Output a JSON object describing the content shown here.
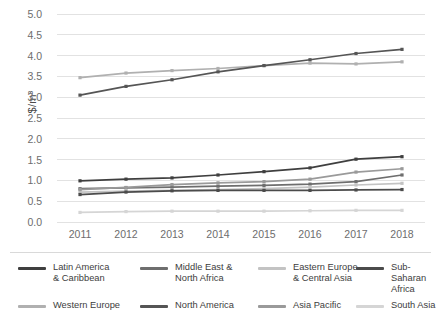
{
  "chart_data": {
    "type": "line",
    "title": "",
    "xlabel": "",
    "ylabel": "$/m³",
    "x": [
      2011,
      2012,
      2013,
      2014,
      2015,
      2016,
      2017,
      2018
    ],
    "xtick_labels": [
      "2011",
      "2012",
      "2013",
      "2014",
      "2015",
      "2016",
      "2017",
      "2018"
    ],
    "ytick_labels": [
      "5.0",
      "4.5",
      "4.0",
      "3.5",
      "3.0",
      "2.5",
      "2.0",
      "1.5",
      "1.0",
      "0.5",
      "0.0"
    ],
    "ylim": [
      0.0,
      5.0
    ],
    "ytick_step": 0.5,
    "grid": "horizontal",
    "legend_position": "bottom",
    "markers": true,
    "series": [
      {
        "name": "Latin America\n& Caribbean",
        "legend_label": "Latin America\n& Caribbean",
        "color": "#3f3f3f",
        "values": [
          0.99,
          1.03,
          1.06,
          1.13,
          1.21,
          1.3,
          1.51,
          1.57
        ]
      },
      {
        "name": "Middle East &\nNorth Africa",
        "legend_label": "Middle East &\nNorth Africa",
        "color": "#6e6e6e",
        "values": [
          0.8,
          0.82,
          0.84,
          0.86,
          0.88,
          0.91,
          0.97,
          1.13
        ]
      },
      {
        "name": "Eastern Europe\n& Central Asia",
        "legend_label": "Eastern Europe\n& Central Asia",
        "color": "#c3c3c3",
        "values": [
          0.72,
          0.74,
          0.76,
          0.78,
          0.8,
          0.84,
          0.89,
          0.93
        ]
      },
      {
        "name": "Sub-Saharan\nAfrica",
        "legend_label": "Sub-Saharan\nAfrica",
        "color": "#4b4b4b",
        "values": [
          0.66,
          0.72,
          0.75,
          0.76,
          0.76,
          0.76,
          0.77,
          0.78
        ]
      },
      {
        "name": "Western Europe",
        "legend_label": "Western Europe",
        "color": "#b0b0b0",
        "values": [
          3.47,
          3.58,
          3.64,
          3.69,
          3.76,
          3.82,
          3.8,
          3.85
        ]
      },
      {
        "name": "North America",
        "legend_label": "North America",
        "color": "#555555",
        "values": [
          3.05,
          3.26,
          3.42,
          3.61,
          3.76,
          3.9,
          4.05,
          4.15
        ]
      },
      {
        "name": "Asia Pacific",
        "legend_label": "Asia Pacific",
        "color": "#9a9a9a",
        "values": [
          0.78,
          0.83,
          0.9,
          0.94,
          0.97,
          1.03,
          1.2,
          1.28
        ]
      },
      {
        "name": "South Asia",
        "legend_label": "South Asia",
        "color": "#d5d5d5",
        "values": [
          0.23,
          0.25,
          0.26,
          0.26,
          0.26,
          0.27,
          0.28,
          0.28
        ]
      }
    ]
  },
  "legend": {
    "items": [
      {
        "label": "Latin America\n& Caribbean",
        "color": "#3f3f3f"
      },
      {
        "label": "Middle East &\nNorth Africa",
        "color": "#6e6e6e"
      },
      {
        "label": "Eastern Europe\n& Central Asia",
        "color": "#c3c3c3"
      },
      {
        "label": "Sub-Saharan\nAfrica",
        "color": "#4b4b4b"
      },
      {
        "label": "Western Europe",
        "color": "#b0b0b0"
      },
      {
        "label": "North America",
        "color": "#555555"
      },
      {
        "label": "Asia Pacific",
        "color": "#9a9a9a"
      },
      {
        "label": "South Asia",
        "color": "#d5d5d5"
      }
    ]
  },
  "colors": {
    "grid": "#e2e2e2",
    "axis_text": "#6d6d6d",
    "background": "#ffffff"
  }
}
